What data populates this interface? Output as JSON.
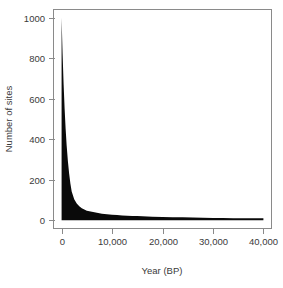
{
  "chart_data": {
    "type": "area",
    "title": "",
    "subtitle": "",
    "xlabel": "Year (BP)",
    "ylabel": "Number of sites",
    "xlim": [
      0,
      40000
    ],
    "ylim": [
      0,
      1000
    ],
    "grid": false,
    "legend": null,
    "legend_position": "none",
    "fill_color": "#000000",
    "background_color": "#ffffff",
    "frame_color": "#8a8a8a",
    "x_ticks": [
      0,
      10000,
      20000,
      30000,
      40000
    ],
    "x_tick_labels": [
      "0",
      "10,000",
      "20,000",
      "30,000",
      "40,000"
    ],
    "y_ticks": [
      0,
      200,
      400,
      600,
      800,
      1000
    ],
    "y_tick_labels": [
      "0",
      "200",
      "400",
      "600",
      "800",
      "1000"
    ],
    "series": [
      {
        "name": "Number of sites",
        "x": [
          0,
          200,
          400,
          600,
          800,
          1000,
          1250,
          1500,
          1750,
          2000,
          2500,
          3000,
          3500,
          4000,
          4500,
          5000,
          6000,
          7000,
          8000,
          9000,
          10000,
          11000,
          12000,
          13000,
          14000,
          15000,
          16000,
          17000,
          18000,
          20000,
          22000,
          24000,
          26000,
          28000,
          30000,
          32000,
          34000,
          36000,
          38000,
          40000
        ],
        "values": [
          1000,
          820,
          672,
          551,
          452,
          371,
          292,
          230,
          181,
          143,
          104,
          83,
          70,
          60,
          53,
          48,
          42,
          37,
          33,
          30,
          28,
          26,
          24,
          23,
          22,
          21,
          20,
          19,
          18,
          17,
          16,
          15,
          14,
          13,
          12,
          12,
          11,
          11,
          10,
          10
        ]
      }
    ]
  },
  "labels": {
    "x_title": "Year (BP)",
    "y_title": "Number of sites"
  }
}
